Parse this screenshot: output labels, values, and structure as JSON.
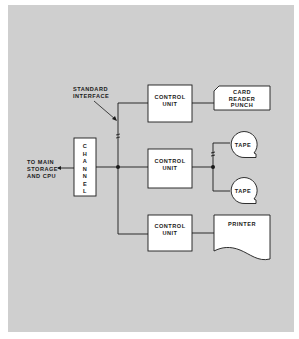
{
  "diagram": {
    "background_color": "#cfcfcf",
    "line_color": "#1a1a1a",
    "box_fill": "#ffffff",
    "annotation": {
      "line1": "STANDARD",
      "line2": "INTERFACE"
    },
    "host": {
      "line1": "TO MAIN",
      "line2": "STORAGE",
      "line3": "AND CPU"
    },
    "channel": {
      "letters": [
        "C",
        "H",
        "A",
        "N",
        "N",
        "E",
        "L"
      ]
    },
    "control_units": [
      {
        "line1": "CONTROL",
        "line2": "UNIT"
      },
      {
        "line1": "CONTROL",
        "line2": "UNIT"
      },
      {
        "line1": "CONTROL",
        "line2": "UNIT"
      }
    ],
    "devices": {
      "card": {
        "line1": "CARD",
        "line2": "READER",
        "line3": "PUNCH"
      },
      "tape1": {
        "label": "TAPE"
      },
      "tape2": {
        "label": "TAPE"
      },
      "printer": {
        "label": "PRINTER"
      }
    }
  }
}
